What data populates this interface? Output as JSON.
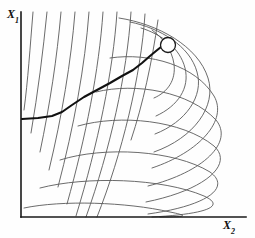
{
  "figure": {
    "kind": "contour-plot-with-search-path",
    "background_color": "#fefefe",
    "width": 255,
    "height": 238
  },
  "axes": {
    "y_axis": {
      "label_main": "X",
      "label_sub": "1",
      "color": "#1a1a1a",
      "x": 21,
      "y_top": 12,
      "y_bottom": 217
    },
    "x_axis": {
      "label_main": "X",
      "label_sub": "2",
      "color": "#1a1a1a",
      "y": 217,
      "x_left": 21,
      "x_right": 246
    }
  },
  "optimum_marker": {
    "name": "optimum-circle",
    "cx": 168,
    "cy": 45,
    "r": 7.5,
    "stroke": "#1a1a1a",
    "stroke_width": 1.3,
    "fill": "#ffffff"
  },
  "search_path": {
    "name": "search-path",
    "stroke": "#111111",
    "stroke_width": 2.1,
    "start_point": [
      22,
      119
    ],
    "end_point": [
      161,
      47
    ],
    "points": [
      [
        22,
        119
      ],
      [
        38,
        118
      ],
      [
        52,
        116
      ],
      [
        62,
        112
      ],
      [
        72,
        105
      ],
      [
        84,
        97
      ],
      [
        97,
        90
      ],
      [
        110,
        83
      ],
      [
        122,
        76
      ],
      [
        133,
        70
      ],
      [
        142,
        63
      ],
      [
        150,
        56
      ],
      [
        156,
        51
      ],
      [
        161,
        47
      ]
    ]
  },
  "chart_data": {
    "type": "line",
    "title": "",
    "xlabel": "X2",
    "ylabel": "X1",
    "legend": [],
    "grid": false,
    "contour_color": "#5a5a5a",
    "contour_stroke_width": 0.9,
    "contour_count": 20,
    "series": [
      {
        "name": "contour-1",
        "path": "M 33 12 C 30 48, 28 80, 24 110"
      },
      {
        "name": "contour-2",
        "path": "M 47 12 C 43 52, 38 92, 31 133"
      },
      {
        "name": "contour-3",
        "path": "M 61 12 C 57 58, 50 104, 40 152"
      },
      {
        "name": "contour-4",
        "path": "M 75 12 C 71 62, 62 116, 49 170"
      },
      {
        "name": "contour-5",
        "path": "M 89 12 C 85 66, 74 126, 58 187"
      },
      {
        "name": "contour-6",
        "path": "M 103 12 C 99 70, 86 136, 67 204"
      },
      {
        "name": "contour-7",
        "path": "M 117 12 C 113 72, 98 144, 76 216"
      },
      {
        "name": "contour-8",
        "path": "M 131 12 C 127 74, 110 150, 86 217"
      },
      {
        "name": "contour-9",
        "path": "M 145 14 C 141 76, 122 154, 97 217"
      },
      {
        "name": "contour-10-inner-left",
        "path": "M 158 20 C 152 62, 143 104, 131 140"
      },
      {
        "name": "contour-11-inner-loop",
        "path": "M 152 30 C 163 38, 172 50, 174 64 C 176 80, 168 92, 154 98"
      },
      {
        "name": "contour-12-loop",
        "path": "M 141 28 C 161 34, 180 48, 185 68 C 190 88, 178 106, 156 116"
      },
      {
        "name": "contour-13-loop",
        "path": "M 130 22 C 160 28, 190 46, 197 72 C 204 96, 186 122, 155 134"
      },
      {
        "name": "contour-14-arc",
        "path": "M 119 18 C 158 24, 198 46, 208 78 C 217 106, 194 138, 154 152"
      },
      {
        "name": "contour-15-arc",
        "path": "M 110 58 C 150 52, 196 66, 214 96 C 228 120, 200 152, 152 168"
      },
      {
        "name": "contour-16-arc",
        "path": "M 96 92 C 136 82, 190 92, 216 120 C 234 142, 204 172, 148 186"
      },
      {
        "name": "contour-17-arc",
        "path": "M 78 126 C 120 114, 182 120, 214 146 C 234 164, 206 190, 146 202"
      },
      {
        "name": "contour-18-arc",
        "path": "M 60 160 C 104 146, 174 150, 210 172 C 232 188, 206 206, 148 214"
      },
      {
        "name": "contour-19-arc",
        "path": "M 40 188 C 86 176, 162 178, 204 196 C 226 206, 208 214, 152 217"
      },
      {
        "name": "contour-20-arc",
        "path": "M 24 208 C 62 200, 126 202, 170 212 C 190 216, 186 217, 160 217"
      }
    ]
  }
}
